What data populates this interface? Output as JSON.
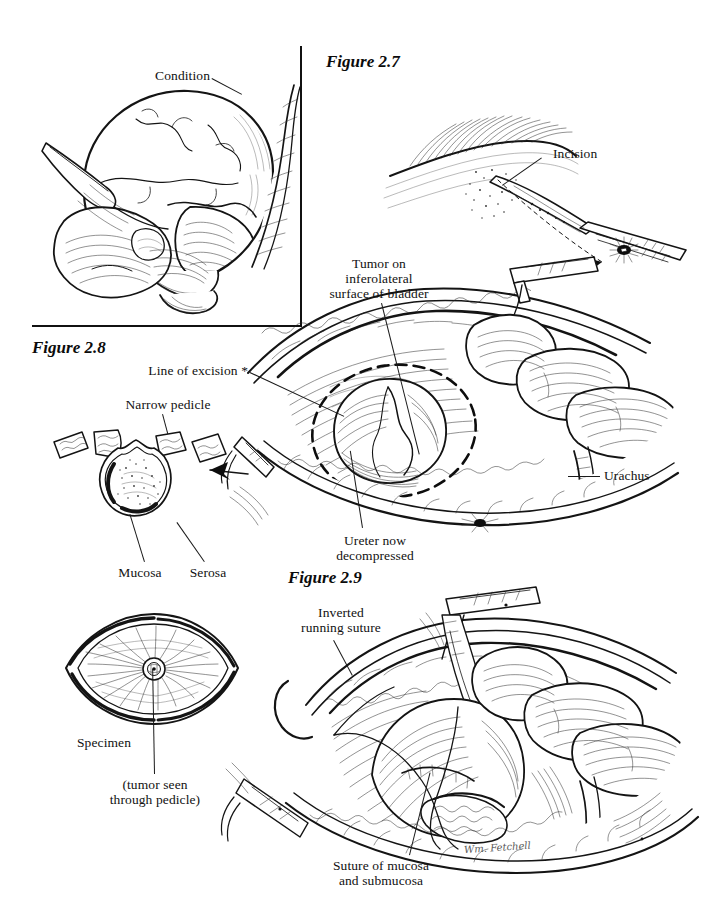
{
  "page": {
    "kind": "surgical-atlas-plate",
    "background": "#ffffff",
    "ink": "#111111"
  },
  "figures": [
    {
      "id": "fig-2-7",
      "title": "Figure 2.7",
      "labels": [
        {
          "name": "condition",
          "text": "Condition"
        },
        {
          "name": "incision",
          "text": "Incision"
        }
      ]
    },
    {
      "id": "fig-2-8",
      "title": "Figure 2.8",
      "labels": [
        {
          "name": "line-of-excision",
          "text": "Line of excision *"
        },
        {
          "name": "narrow-pedicle",
          "text": "Narrow pedicle"
        },
        {
          "name": "mucosa",
          "text": "Mucosa"
        },
        {
          "name": "serosa",
          "text": "Serosa"
        },
        {
          "name": "specimen",
          "text": "Specimen"
        },
        {
          "name": "tumor-seen-through-pedicle-1",
          "text": "(tumor seen"
        },
        {
          "name": "tumor-seen-through-pedicle-2",
          "text": "through pedicle)"
        }
      ]
    },
    {
      "id": "fig-2-9",
      "title": "Figure 2.9",
      "labels": [
        {
          "name": "inverted-running-suture-1",
          "text": "Inverted"
        },
        {
          "name": "inverted-running-suture-2",
          "text": "running suture"
        },
        {
          "name": "suture-of-mucosa-1",
          "text": "Suture of mucosa"
        },
        {
          "name": "suture-of-mucosa-2",
          "text": "and submucosa"
        }
      ]
    }
  ],
  "main_scene": {
    "labels": [
      {
        "name": "tumor-line-1",
        "text": "Tumor on"
      },
      {
        "name": "tumor-line-2",
        "text": "inferolateral"
      },
      {
        "name": "tumor-line-3",
        "text": "surface of bladder"
      },
      {
        "name": "ureter-line-1",
        "text": "Ureter now"
      },
      {
        "name": "ureter-line-2",
        "text": "decompressed"
      },
      {
        "name": "urachus",
        "text": "Urachus"
      }
    ]
  },
  "artist_signature": "Wm. Fetchell",
  "fig27_title": "Figure 2.7",
  "fig28_title": "Figure 2.8",
  "fig29_title": "Figure 2.9",
  "t": {
    "condition": "Condition",
    "incision": "Incision",
    "tumor1": "Tumor on",
    "tumor2": "inferolateral",
    "tumor3": "surface of bladder",
    "line_excision": "Line of excision *",
    "narrow_pedicle": "Narrow pedicle",
    "mucosa": "Mucosa",
    "serosa": "Serosa",
    "specimen": "Specimen",
    "tumorseen1": "(tumor seen",
    "tumorseen2": "through pedicle)",
    "ureter1": "Ureter now",
    "ureter2": "decompressed",
    "urachus": "Urachus",
    "inverted1": "Inverted",
    "inverted2": "running suture",
    "sutmuc1": "Suture of mucosa",
    "sutmuc2": "and submucosa",
    "signature": "Wm. Fetchell"
  }
}
